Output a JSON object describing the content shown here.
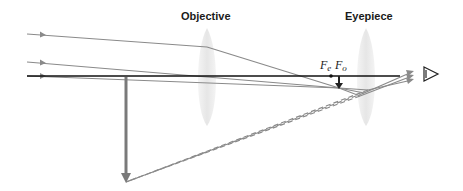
{
  "labels": {
    "objective": "Objective",
    "eyepiece": "Eyepiece"
  },
  "focal_points": {
    "fe": {
      "main": "F",
      "sub": "e"
    },
    "fo": {
      "main": "F",
      "sub": "o"
    }
  },
  "colors": {
    "ray": "#8a8a8a",
    "axis": "#111111",
    "image_arrow": "#7a7a7a",
    "lens": "#ececec",
    "virtual_ray": "#8a8a8a"
  },
  "icons": {
    "eye": "eye-icon",
    "object_arrow": "arrow-down-icon",
    "image_arrow": "arrow-down-icon"
  }
}
